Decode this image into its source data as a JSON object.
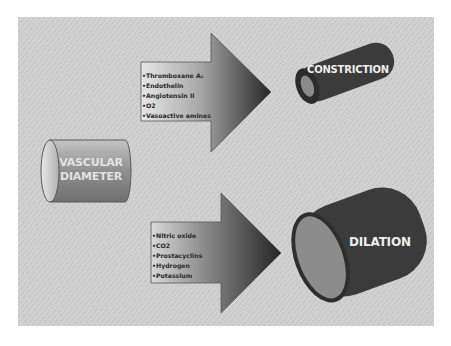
{
  "diagram": {
    "source_node": {
      "label_line1": "VASCULAR",
      "label_line2": "DIAMETER",
      "shape": "horizontal-cylinder"
    },
    "constriction": {
      "arrow_items": [
        "Thromboxane A₂",
        "Endothelin",
        "Angiotensin II",
        "O2",
        "Vasoactive amines"
      ],
      "result_label": "CONSTRICTION",
      "shape": "narrow-tilted-cylinder"
    },
    "dilation": {
      "arrow_items": [
        "Nitric oxide",
        "CO2",
        "Prostacyclins",
        "Hydrogen",
        "Potassium"
      ],
      "result_label": "DILATION",
      "shape": "wide-tilted-cylinder"
    },
    "edges": [
      {
        "from": "VASCULAR DIAMETER",
        "to": "CONSTRICTION"
      },
      {
        "from": "VASCULAR DIAMETER",
        "to": "DILATION"
      }
    ],
    "colors": {
      "panel_background": "#cfcfcf",
      "arrow_light": "#d8d8d8",
      "arrow_dark": "#2e2e2e",
      "vessel_dark": "#3a3a3a",
      "vessel_lumen": "#8a8a8a",
      "source_cylinder": "#9a9a9a",
      "label_text": "#eeeeee"
    }
  }
}
